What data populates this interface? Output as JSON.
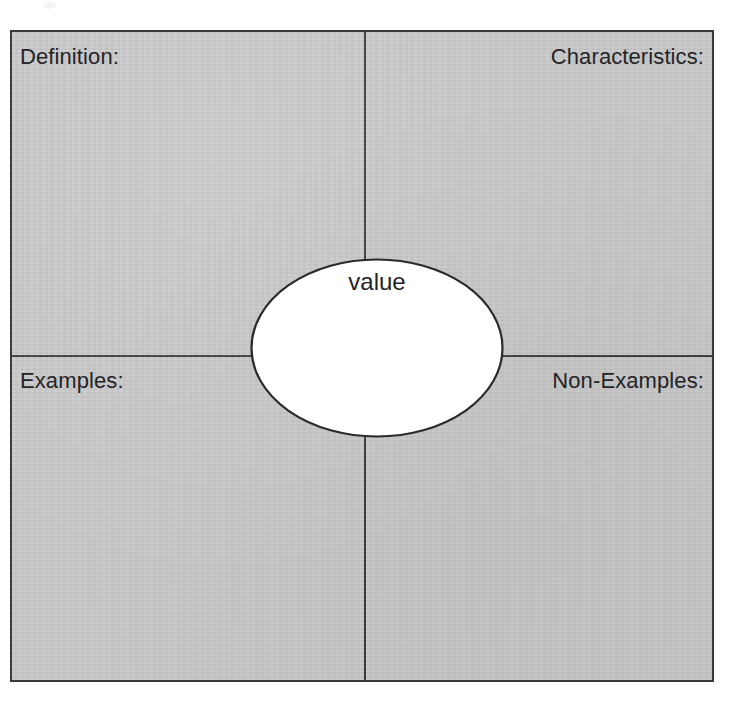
{
  "document": {
    "type": "frayer-model-graphic-organizer",
    "background_color": "#ffffff",
    "frame_fill_color": "#c8c8c8",
    "line_color": "#3b3b3f",
    "text_color": "#242428"
  },
  "center": {
    "term": "value",
    "shape": "ellipse",
    "fill_color": "#ffffff"
  },
  "quadrants": [
    {
      "id": "definition",
      "label": "Definition:",
      "position": "top-left",
      "align": "left",
      "content": ""
    },
    {
      "id": "characteristics",
      "label": "Characteristics:",
      "position": "top-right",
      "align": "right",
      "content": ""
    },
    {
      "id": "examples",
      "label": "Examples:",
      "position": "bottom-left",
      "align": "left",
      "content": ""
    },
    {
      "id": "non_examples",
      "label": "Non-Examples:",
      "position": "bottom-right",
      "align": "right",
      "content": ""
    }
  ]
}
